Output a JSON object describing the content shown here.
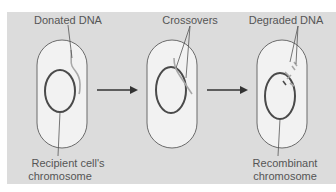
{
  "figure": {
    "colors": {
      "panel": "#dcdcdc",
      "cell_fill": "#f2f2f2",
      "cell_outline": "#6b6b6b",
      "chromosome": "#4a4a4a",
      "donated_dna": "#a8a8a8",
      "arrow": "#333333",
      "label_text": "#555555"
    },
    "stages": [
      {
        "id": "stage-1",
        "labels": {
          "top": "Donated DNA",
          "bottom_line1": "Recipient cell's",
          "bottom_line2": "chromosome"
        }
      },
      {
        "id": "stage-2",
        "labels": {
          "top": "Crossovers"
        }
      },
      {
        "id": "stage-3",
        "labels": {
          "top": "Degraded DNA",
          "bottom_line1": "Recombinant",
          "bottom_line2": "chromosome"
        }
      }
    ],
    "arrows": [
      {
        "from": "stage-1",
        "to": "stage-2"
      },
      {
        "from": "stage-2",
        "to": "stage-3"
      }
    ]
  }
}
